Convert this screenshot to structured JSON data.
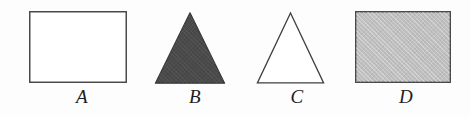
{
  "figure": {
    "width": 470,
    "height": 116,
    "background_color": "#fdfdfd",
    "stroke_color": "#3a3a3a"
  },
  "shapes": [
    {
      "id": "a",
      "label": "A",
      "kind": "rectangle",
      "fill_name": "white",
      "fill_color": "#ffffff",
      "stroke_color": "#4a4a4a",
      "width": 98,
      "height": 72,
      "textured": false
    },
    {
      "id": "b",
      "label": "B",
      "kind": "triangle",
      "fill_name": "dark-gray",
      "fill_color": "#4a4a4a",
      "stroke_color": "#3a3a3a",
      "width": 70,
      "height": 71,
      "textured": true
    },
    {
      "id": "c",
      "label": "C",
      "kind": "triangle",
      "fill_name": "white",
      "fill_color": "#ffffff",
      "stroke_color": "#3f3f3f",
      "width": 67,
      "height": 71,
      "textured": false
    },
    {
      "id": "d",
      "label": "D",
      "kind": "rectangle",
      "fill_name": "light-gray",
      "fill_color": "#bfbfbf",
      "stroke_color": "#4a4a4a",
      "width": 96,
      "height": 72,
      "textured": true
    }
  ]
}
